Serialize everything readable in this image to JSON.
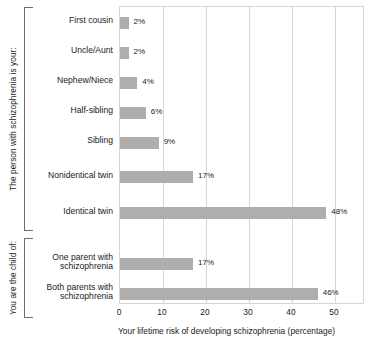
{
  "chart_data": {
    "type": "bar",
    "orientation": "horizontal",
    "title": "",
    "xlabel": "Your lifetime risk of developing schizophrenia (percentage)",
    "ylabel": "",
    "xlim": [
      0,
      57
    ],
    "xticks": [
      0,
      10,
      20,
      30,
      40,
      50
    ],
    "xticklabels": [
      "0",
      "10",
      "20",
      "30",
      "40",
      "50"
    ],
    "grid": true,
    "grid_axis": "x",
    "legend": "none",
    "bar_color": "#aeaeae",
    "groups": [
      {
        "group_label": "The person with schizophrenia is your:",
        "categories": [
          "First cousin",
          "Uncle/Aunt",
          "Nephew/Niece",
          "Half-sibling",
          "Sibling",
          "Nonidentical twin",
          "Identical twin"
        ],
        "values": [
          2,
          2,
          4,
          6,
          9,
          17,
          48
        ],
        "value_labels": [
          "2%",
          "2%",
          "4%",
          "6%",
          "9%",
          "17%",
          "48%"
        ]
      },
      {
        "group_label": "You are the child of:",
        "categories": [
          "One parent with\nschizophrenia",
          "Both parents with\nschizophrenia"
        ],
        "values": [
          17,
          46
        ],
        "value_labels": [
          "17%",
          "46%"
        ]
      }
    ]
  }
}
